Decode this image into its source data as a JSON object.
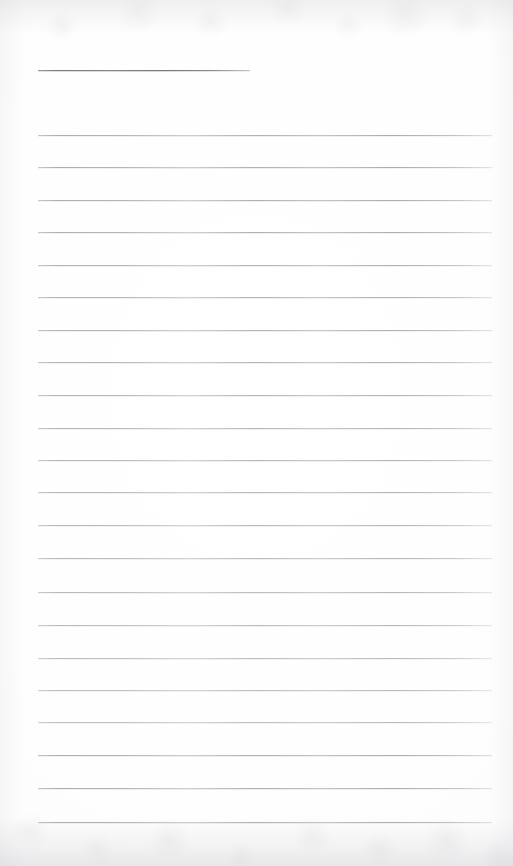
{
  "document": {
    "type": "scanned-lined-paper",
    "title": "",
    "page_width": 513,
    "page_height": 866,
    "background_color": "#fdfdfd",
    "has_text": false,
    "visible_text": "",
    "notes": ""
  },
  "colors": {
    "paper": "#fdfdfd",
    "rule_line": "#b4b6b9",
    "heading_rule_line": "#8d9095",
    "edge_shadow": "#91949a"
  },
  "heading_rule": {
    "name": "heading-rule",
    "x": 38,
    "y": 70,
    "width": 212,
    "thickness": 1,
    "color": "#8d9095"
  },
  "ruled_lines": {
    "count": 22,
    "x": 38,
    "width": 454,
    "first_y": 135,
    "spacing": 32.5,
    "thickness": 1,
    "color": "#b4b6b9",
    "lines": [
      {
        "index": 1,
        "y": 135
      },
      {
        "index": 2,
        "y": 167
      },
      {
        "index": 3,
        "y": 200
      },
      {
        "index": 4,
        "y": 232
      },
      {
        "index": 5,
        "y": 265
      },
      {
        "index": 6,
        "y": 297
      },
      {
        "index": 7,
        "y": 330
      },
      {
        "index": 8,
        "y": 362
      },
      {
        "index": 9,
        "y": 395
      },
      {
        "index": 10,
        "y": 428
      },
      {
        "index": 11,
        "y": 460
      },
      {
        "index": 12,
        "y": 492
      },
      {
        "index": 13,
        "y": 525
      },
      {
        "index": 14,
        "y": 558
      },
      {
        "index": 15,
        "y": 592
      },
      {
        "index": 16,
        "y": 625
      },
      {
        "index": 17,
        "y": 658
      },
      {
        "index": 18,
        "y": 690
      },
      {
        "index": 19,
        "y": 722
      },
      {
        "index": 20,
        "y": 755
      },
      {
        "index": 21,
        "y": 788
      },
      {
        "index": 22,
        "y": 822
      }
    ]
  },
  "edges": {
    "top_shadow_height": 34,
    "bottom_shadow_height": 48,
    "side_shadow_width": 26
  }
}
